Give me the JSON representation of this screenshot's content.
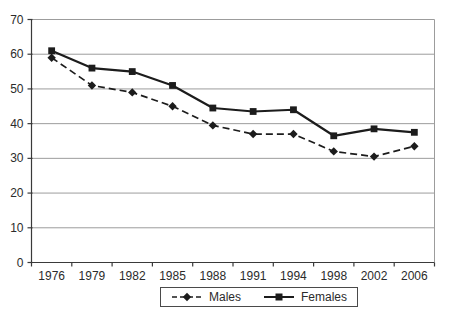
{
  "chart_data": {
    "type": "line",
    "title": "",
    "xlabel": "",
    "ylabel": "",
    "categories": [
      "1976",
      "1979",
      "1982",
      "1985",
      "1988",
      "1991",
      "1994",
      "1998",
      "2002",
      "2006"
    ],
    "series": [
      {
        "name": "Males",
        "values": [
          59,
          51,
          49,
          45,
          39.5,
          37,
          37,
          32,
          30.5,
          33.5
        ],
        "line_style": "dashed",
        "marker": "diamond"
      },
      {
        "name": "Females",
        "values": [
          61,
          56,
          55,
          51,
          44.5,
          43.5,
          44,
          36.5,
          38.5,
          37.5
        ],
        "line_style": "solid",
        "marker": "square"
      }
    ],
    "ylim": [
      0,
      70
    ],
    "yticks": [
      0,
      10,
      20,
      30,
      40,
      50,
      60,
      70
    ],
    "grid": "horizontal",
    "legend_position": "bottom-center"
  },
  "colors": {
    "ink": "#1c1c1c",
    "grid": "#9c9c9c",
    "axis": "#3a3a3a",
    "text": "#2b2b2b",
    "background": "#ffffff",
    "legend_border": "#4a4a4a"
  }
}
